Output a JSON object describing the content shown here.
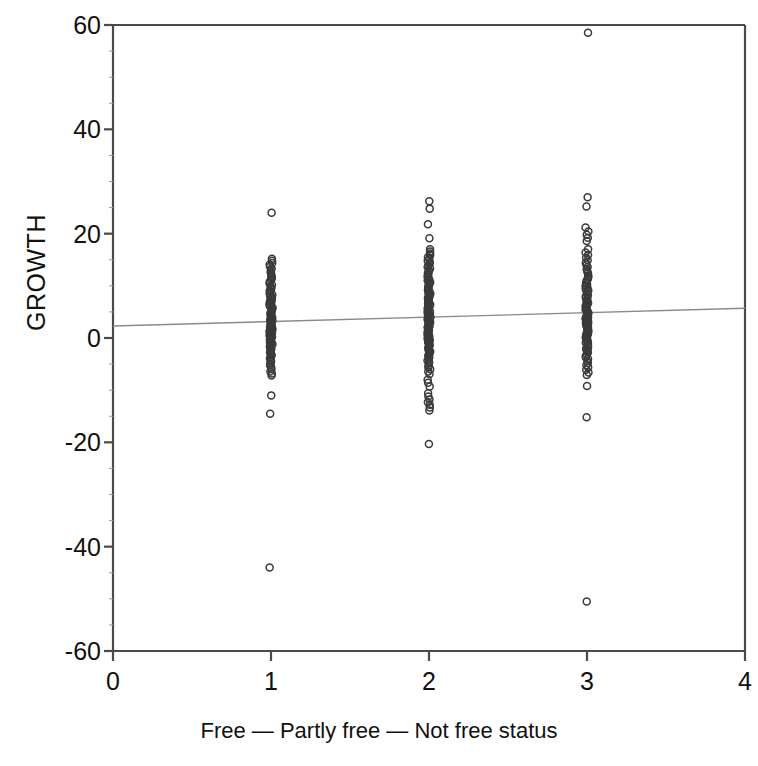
{
  "chart_data": {
    "type": "scatter",
    "title": "",
    "subtitle": "",
    "xlabel": "Free — Partly free — Not free status",
    "ylabel": "GROWTH",
    "xlim": [
      0,
      4
    ],
    "ylim": [
      -60,
      60
    ],
    "xticks": [
      0,
      1,
      2,
      3,
      4
    ],
    "xtick_labels": [
      "0",
      "1",
      "2",
      "3",
      "4"
    ],
    "yticks": [
      -60,
      -40,
      -20,
      0,
      20,
      40,
      60
    ],
    "ytick_labels": [
      "-60",
      "-40",
      "-20",
      "0",
      "20",
      "40",
      "60"
    ],
    "grid": false,
    "legend": null,
    "marker": "open-circle",
    "marker_color": "#3a3a3a",
    "marker_size": 7,
    "frame_color": "#4a4a4a",
    "annotations": [],
    "series": [
      {
        "name": "Free (status = 1)",
        "x": 1,
        "values": [
          24.0,
          15.2,
          14.8,
          14.4,
          14.1,
          13.7,
          13.3,
          13.0,
          12.6,
          12.3,
          12.0,
          11.7,
          11.4,
          11.1,
          10.8,
          10.5,
          10.2,
          9.9,
          9.6,
          9.3,
          9.0,
          8.8,
          8.5,
          8.3,
          8.0,
          7.8,
          7.5,
          7.3,
          7.1,
          6.9,
          6.7,
          6.5,
          6.3,
          6.1,
          5.9,
          5.7,
          5.5,
          5.3,
          5.1,
          4.9,
          4.8,
          4.6,
          4.4,
          4.3,
          4.1,
          3.9,
          3.8,
          3.6,
          3.5,
          3.3,
          3.2,
          3.0,
          2.9,
          2.7,
          2.6,
          2.4,
          2.3,
          2.1,
          2.0,
          1.8,
          1.7,
          1.5,
          1.4,
          1.2,
          1.1,
          0.9,
          0.8,
          0.6,
          0.5,
          0.3,
          0.2,
          0.0,
          -0.2,
          -0.4,
          -0.6,
          -0.8,
          -1.0,
          -1.2,
          -1.4,
          -1.6,
          -1.8,
          -2.0,
          -2.3,
          -2.5,
          -2.8,
          -3.0,
          -3.3,
          -3.6,
          -3.9,
          -4.2,
          -4.5,
          -4.9,
          -5.2,
          -5.6,
          -6.0,
          -6.4,
          -6.8,
          -7.2,
          -11.0,
          -14.5,
          -44.0
        ]
      },
      {
        "name": "Partly free (status = 2)",
        "x": 2,
        "values": [
          26.2,
          24.8,
          21.8,
          19.1,
          17.0,
          16.6,
          16.2,
          15.9,
          15.5,
          15.2,
          14.8,
          14.5,
          14.2,
          13.9,
          13.6,
          13.3,
          13.0,
          12.7,
          12.4,
          12.1,
          11.8,
          11.5,
          11.2,
          11.0,
          10.7,
          10.4,
          10.2,
          9.9,
          9.7,
          9.4,
          9.2,
          8.9,
          8.7,
          8.5,
          8.2,
          8.0,
          7.8,
          7.6,
          7.4,
          7.2,
          7.0,
          6.8,
          6.6,
          6.4,
          6.2,
          6.0,
          5.8,
          5.6,
          5.4,
          5.2,
          5.0,
          4.8,
          4.7,
          4.5,
          4.3,
          4.1,
          4.0,
          3.8,
          3.6,
          3.5,
          3.3,
          3.1,
          3.0,
          2.8,
          2.6,
          2.5,
          2.3,
          2.1,
          2.0,
          1.8,
          1.6,
          1.5,
          1.3,
          1.1,
          1.0,
          0.8,
          0.6,
          0.4,
          0.3,
          0.1,
          -0.1,
          -0.3,
          -0.5,
          -0.7,
          -0.9,
          -1.1,
          -1.3,
          -1.5,
          -1.7,
          -1.9,
          -2.2,
          -2.4,
          -2.6,
          -2.9,
          -3.1,
          -3.4,
          -3.7,
          -4.0,
          -4.3,
          -4.6,
          -4.9,
          -5.3,
          -5.6,
          -6.0,
          -6.4,
          -6.9,
          -8.0,
          -8.6,
          -9.3,
          -10.6,
          -11.2,
          -11.8,
          -12.3,
          -12.8,
          -13.3,
          -13.9,
          -20.3
        ]
      },
      {
        "name": "Not free (status = 3)",
        "x": 3,
        "values": [
          58.5,
          27.0,
          25.2,
          21.2,
          20.4,
          19.8,
          19.2,
          18.6,
          17.0,
          16.4,
          15.9,
          15.4,
          14.9,
          14.4,
          14.0,
          13.6,
          13.2,
          12.8,
          12.4,
          12.0,
          11.7,
          11.3,
          11.0,
          10.6,
          10.3,
          10.0,
          9.7,
          9.4,
          9.1,
          8.8,
          8.5,
          8.2,
          8.0,
          7.7,
          7.5,
          7.2,
          7.0,
          6.7,
          6.5,
          6.3,
          6.1,
          5.8,
          5.6,
          5.4,
          5.2,
          5.0,
          4.8,
          4.6,
          4.4,
          4.2,
          4.0,
          3.8,
          3.7,
          3.5,
          3.3,
          3.1,
          2.9,
          2.8,
          2.6,
          2.4,
          2.2,
          2.1,
          1.9,
          1.7,
          1.5,
          1.4,
          1.2,
          1.0,
          0.8,
          0.7,
          0.5,
          0.3,
          0.1,
          -0.1,
          -0.3,
          -0.5,
          -0.7,
          -0.9,
          -1.1,
          -1.3,
          -1.5,
          -1.8,
          -2.0,
          -2.3,
          -2.5,
          -2.8,
          -3.1,
          -3.4,
          -3.7,
          -4.0,
          -4.4,
          -4.8,
          -5.2,
          -5.6,
          -6.1,
          -6.6,
          -7.1,
          -9.2,
          -15.2,
          -50.5
        ]
      }
    ],
    "fit_line": {
      "name": "regression line",
      "x_start": 0,
      "y_start": 2.3,
      "x_end": 4,
      "y_end": 5.7,
      "color": "#8a8a8a"
    }
  }
}
